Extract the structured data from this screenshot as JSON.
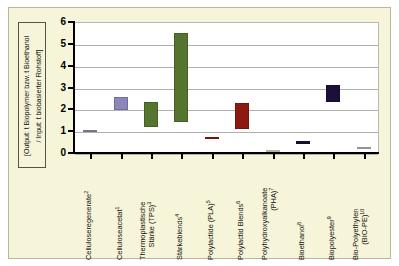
{
  "chart_data": {
    "type": "bar",
    "subtype": "floating-range-bar",
    "title": "",
    "xlabel": "",
    "ylabel": "[Output: t Biopolymer bzw. t Bioethanol / Input: t biobasierter Rohstoff]",
    "ylabel_lines": [
      "[Output: t Biopolymer bzw. t Bioethanol",
      "/ Input: t biobasierter Rohstoff]"
    ],
    "ylim": [
      0,
      6
    ],
    "yticks": [
      0,
      1,
      2,
      3,
      4,
      5,
      6
    ],
    "ytick_labels": [
      "0",
      "1",
      "2",
      "3",
      "4",
      "5",
      "6"
    ],
    "grid": true,
    "legend": false,
    "categories": [
      "Celluloseregenerate",
      "Celluloseacetat",
      "Thermoplastische Stärke (TPS)",
      "Stärkeblends",
      "Polylactide (PLA)",
      "Polylactid Blends",
      "Polyhydroxyalkanoate (PHA)",
      "Bioethanol",
      "Biopolyester",
      "Bio-Polyethylen (BIO-PE)"
    ],
    "category_labels": [
      {
        "line1": "Celluloseregenerate",
        "line2": "",
        "footnote": "2"
      },
      {
        "line1": "Celluloseacetat",
        "line2": "",
        "footnote": "1"
      },
      {
        "line1": "Thermoplastische",
        "line2": "Stärke (TPS)",
        "footnote": "3"
      },
      {
        "line1": "Stärkeblends",
        "line2": "",
        "footnote": "4"
      },
      {
        "line1": "Polylactide (PLA)",
        "line2": "",
        "footnote": "5"
      },
      {
        "line1": "Polylactid Blends",
        "line2": "",
        "footnote": "6"
      },
      {
        "line1": "Polyhydroxyalkanoate",
        "line2": "(PHA)",
        "footnote": "7"
      },
      {
        "line1": "Bioethanol",
        "line2": "",
        "footnote": "8"
      },
      {
        "line1": "Biopolyester",
        "line2": "",
        "footnote": "9"
      },
      {
        "line1": "Bio-Polyethylen",
        "line2": "(BIO-PE)",
        "footnote": "10"
      }
    ],
    "bars": [
      {
        "category": "Celluloseregenerate",
        "low": 1.0,
        "high": 1.1,
        "color": "#8a8fae"
      },
      {
        "category": "Celluloseacetat",
        "low": 2.0,
        "high": 2.6,
        "color": "#8a87bb"
      },
      {
        "category": "Thermoplastische Stärke (TPS)",
        "low": 1.25,
        "high": 2.4,
        "color": "#55752f"
      },
      {
        "category": "Stärkeblends",
        "low": 1.45,
        "high": 5.55,
        "color": "#55752f"
      },
      {
        "category": "Polylactide (PLA)",
        "low": 0.7,
        "high": 0.8,
        "color": "#8c1a10"
      },
      {
        "category": "Polylactid Blends",
        "low": 1.15,
        "high": 2.35,
        "color": "#8c1a10"
      },
      {
        "category": "Polyhydroxyalkanoate (PHA)",
        "low": 0.15,
        "high": 0.2,
        "color": "#e0dcb0"
      },
      {
        "category": "Bioethanol",
        "low": 0.45,
        "high": 0.6,
        "color": "#1d1038"
      },
      {
        "category": "Biopolyester",
        "low": 2.4,
        "high": 3.15,
        "color": "#1d1038"
      },
      {
        "category": "Bio-Polyethylen (BIO-PE)",
        "low": 0.25,
        "high": 0.32,
        "color": "#b3b3b3"
      }
    ],
    "colors": {
      "background": "#f7f5d9",
      "plot_background": "#ffffff",
      "gridline": "#b0b0b0",
      "axis": "#000000"
    }
  }
}
